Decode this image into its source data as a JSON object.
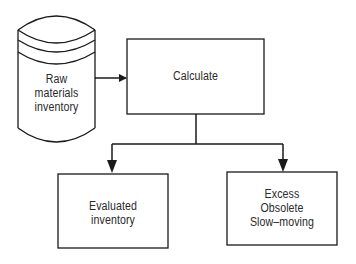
{
  "diagram": {
    "nodes": {
      "raw_materials": {
        "shape": "cylinder",
        "lines": [
          "Raw",
          "materials",
          "inventory"
        ]
      },
      "calculate": {
        "shape": "rectangle",
        "lines": [
          "Calculate"
        ]
      },
      "evaluated": {
        "shape": "rectangle",
        "lines": [
          "Evaluated",
          "inventory"
        ]
      },
      "excess": {
        "shape": "rectangle",
        "lines": [
          "Excess",
          "Obsolete",
          "Slow–moving"
        ]
      }
    },
    "edges": [
      {
        "from": "raw_materials",
        "to": "calculate"
      },
      {
        "from": "calculate",
        "to": "evaluated"
      },
      {
        "from": "calculate",
        "to": "excess"
      }
    ],
    "colors": {
      "stroke": "#1a1a1a",
      "background": "#ffffff",
      "text": "#2a2a2a"
    }
  }
}
